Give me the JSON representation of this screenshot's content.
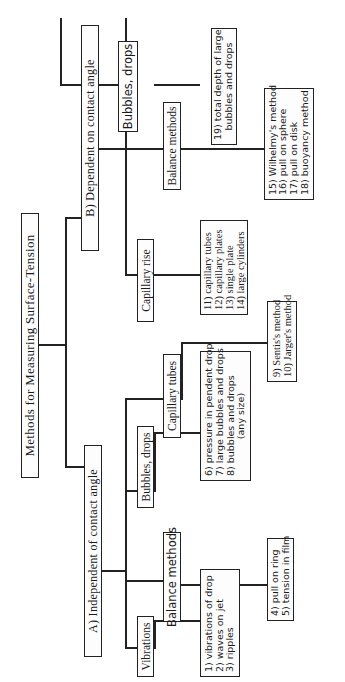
{
  "title": "Methods for Measuring Surface-Tension",
  "branches": {
    "A": {
      "label": "A) Independent of contact angle",
      "categories": {
        "vibrations": {
          "label": "Vibrations",
          "methods": [
            "1) vibrations of drop",
            "2) waves on jet",
            "3) ripples"
          ]
        },
        "balance": {
          "label": "Balance methods",
          "methods": [
            "4) pull on ring",
            "5) tension in film"
          ]
        },
        "bubbles": {
          "label": "Bubbles, drops",
          "methods": [
            "6) pressure in pendent drop",
            "7) large bubbles and drops",
            "8) bubbles and drops",
            "(any size)"
          ]
        },
        "capillary": {
          "label": "Capillary tubes",
          "methods": [
            "9) Sentis's method",
            "10) Jarger's method"
          ]
        }
      }
    },
    "B": {
      "label": "B) Dependent on contact angle",
      "categories": {
        "capillary_rise": {
          "label": "Capillary rise",
          "methods": [
            "11) capillary tubes",
            "12) capillary plates",
            "13) single plate",
            "14) large cylinders"
          ]
        },
        "balance": {
          "label": "Balance methods",
          "methods": [
            "15) Wilhelmy's method",
            "16) pull on sphere",
            "17) pull on disk",
            "18) buoyancy method"
          ]
        },
        "bubbles": {
          "label": "Bubbles, drops",
          "methods": [
            "19) total depth of large",
            "bubbles and drops"
          ]
        }
      }
    }
  }
}
